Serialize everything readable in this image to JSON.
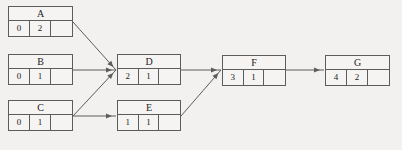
{
  "diagram": {
    "type": "activity-network-diagram",
    "background_color": "#f2f1ef",
    "line_color": "#5c5c5c",
    "text_color": "#1c1c1c",
    "nodes": [
      {
        "id": "A",
        "label": "A",
        "cells": [
          "0",
          "2",
          ""
        ],
        "x": 8,
        "y": 6,
        "width": 65,
        "height": 31
      },
      {
        "id": "B",
        "label": "B",
        "cells": [
          "0",
          "1",
          ""
        ],
        "x": 8,
        "y": 54,
        "width": 65,
        "height": 31
      },
      {
        "id": "C",
        "label": "C",
        "cells": [
          "0",
          "1",
          ""
        ],
        "x": 8,
        "y": 100,
        "width": 65,
        "height": 31
      },
      {
        "id": "D",
        "label": "D",
        "cells": [
          "2",
          "1",
          ""
        ],
        "x": 117,
        "y": 54,
        "width": 64,
        "height": 31
      },
      {
        "id": "E",
        "label": "E",
        "cells": [
          "1",
          "1",
          ""
        ],
        "x": 117,
        "y": 100,
        "width": 64,
        "height": 31
      },
      {
        "id": "F",
        "label": "F",
        "cells": [
          "3",
          "1",
          ""
        ],
        "x": 222,
        "y": 55,
        "width": 64,
        "height": 31
      },
      {
        "id": "G",
        "label": "G",
        "cells": [
          "4",
          "2",
          ""
        ],
        "x": 325,
        "y": 55,
        "width": 65,
        "height": 31
      }
    ],
    "edges": [
      {
        "id": "a-to-d",
        "from": "A",
        "to": "D",
        "x1": 73,
        "y1": 22,
        "x2": 116,
        "y2": 70
      },
      {
        "id": "b-to-d",
        "from": "B",
        "to": "D",
        "x1": 73,
        "y1": 70,
        "x2": 116,
        "y2": 70
      },
      {
        "id": "c-to-d",
        "from": "C",
        "to": "D",
        "x1": 73,
        "y1": 116,
        "x2": 116,
        "y2": 70
      },
      {
        "id": "c-to-e",
        "from": "C",
        "to": "E",
        "x1": 73,
        "y1": 116,
        "x2": 116,
        "y2": 116
      },
      {
        "id": "d-to-f",
        "from": "D",
        "to": "F",
        "x1": 181,
        "y1": 70,
        "x2": 221,
        "y2": 70
      },
      {
        "id": "e-to-f",
        "from": "E",
        "to": "F",
        "x1": 181,
        "y1": 116,
        "x2": 221,
        "y2": 70
      },
      {
        "id": "f-to-g",
        "from": "F",
        "to": "G",
        "x1": 286,
        "y1": 70,
        "x2": 324,
        "y2": 70
      }
    ]
  }
}
